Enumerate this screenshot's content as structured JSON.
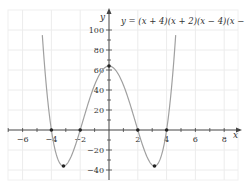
{
  "chart_data": {
    "type": "line",
    "title": "y = (x + 4)(x + 2)(x − 4)(x − 2)",
    "xlabel": "x",
    "ylabel": "y",
    "xlim": [
      -7,
      9
    ],
    "ylim": [
      -50,
      110
    ],
    "grid": true,
    "x_ticks": [
      -6,
      -4,
      -2,
      2,
      4,
      6,
      8
    ],
    "y_ticks": [
      100,
      80,
      60,
      40,
      20,
      -20,
      -40
    ],
    "x_tick_labels": [
      "−6",
      "−4",
      "−2",
      "2",
      "4",
      "6",
      "8"
    ],
    "y_tick_labels": [
      "100",
      "80",
      "60",
      "40",
      "20",
      "−20",
      "−40"
    ],
    "series": [
      {
        "name": "y = (x + 4)(x + 2)(x − 4)(x − 2)",
        "function": "x^4 - 20x^2 + 64",
        "x_range": [
          -4.9,
          4.9
        ],
        "color": "#9a9a9a"
      }
    ],
    "key_points": [
      {
        "x": -4,
        "y": 0,
        "label": "root"
      },
      {
        "x": -2,
        "y": 0,
        "label": "root"
      },
      {
        "x": 2,
        "y": 0,
        "label": "root"
      },
      {
        "x": 4,
        "y": 0,
        "label": "root"
      },
      {
        "x": 0,
        "y": 64,
        "label": "y-intercept / local max"
      },
      {
        "x": -3.16,
        "y": -36,
        "label": "minimum"
      },
      {
        "x": 3.16,
        "y": -36,
        "label": "minimum"
      }
    ]
  },
  "labels": {
    "equation": "y = (x + 4)(x + 2)(x − 4)(x − 2)",
    "x_axis": "x",
    "y_axis": "y"
  }
}
